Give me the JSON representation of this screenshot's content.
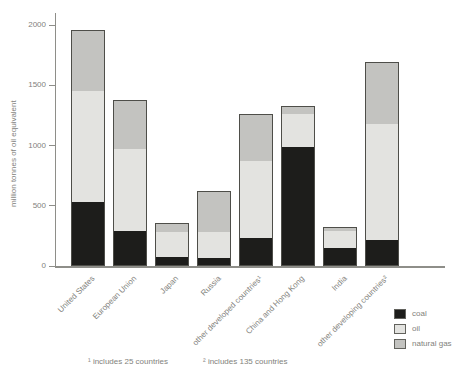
{
  "figure": {
    "background": "#ffffff",
    "axis_color": "#8e8e89",
    "text_color": "#82827c",
    "bar_border_color": "#4e4e49"
  },
  "footnotes": [
    "¹ includes 25 countries",
    "² includes 135 countries"
  ],
  "chart_data": {
    "type": "bar",
    "stacked": true,
    "title": "",
    "xlabel": "",
    "ylabel": "million tonnes of oil equivalent",
    "ylim": [
      0,
      2000
    ],
    "yticks": [
      0,
      500,
      1000,
      1500,
      2000
    ],
    "grid": false,
    "legend_position": "bottom-right",
    "categories": [
      "United States",
      "European Union",
      "Japan",
      "Russia",
      "other developed countries¹",
      "China and Hong Kong",
      "India",
      "other developing countries²"
    ],
    "series": [
      {
        "name": "coal",
        "color": "#1d1d1b",
        "values": [
          520,
          280,
          70,
          60,
          225,
          975,
          140,
          210
        ]
      },
      {
        "name": "oil",
        "color": "#e3e3e0",
        "values": [
          925,
          680,
          205,
          215,
          635,
          275,
          140,
          960
        ]
      },
      {
        "name": "natural gas",
        "color": "#c3c3c0",
        "values": [
          515,
          420,
          85,
          350,
          405,
          75,
          45,
          520
        ]
      }
    ],
    "totals": [
      1960,
      1380,
      360,
      625,
      1265,
      1325,
      325,
      1690
    ]
  }
}
